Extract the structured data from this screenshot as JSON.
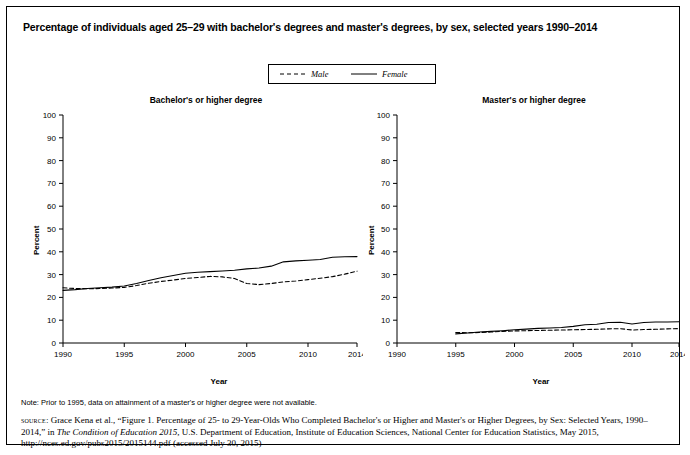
{
  "figure": {
    "title": "Percentage of individuals aged 25–29 with bachelor's degrees and master's degrees, by sex, selected years 1990–2014",
    "note": "Note: Prior to 1995, data on attainment of a master's or higher degree were not available.",
    "source_prefix": "source",
    "source_part1": ": Grace Kena et al., “Figure 1. Percentage of 25- to 29-Year-Olds Who Completed Bachelor's or Higher and Master's or Higher Degrees, by Sex: Selected Years, 1990–2014,” in ",
    "source_italic": "The Condition of Education 2015",
    "source_part2": ", U.S. Department of Education, Institute of Education Sciences, National Center for Education Statistics, May 2015, http://nces.ed.gov/pubs2015/2015144.pdf (accessed July 30, 2015)"
  },
  "legend": {
    "entries": [
      {
        "label": "Male",
        "style": "dashed"
      },
      {
        "label": "Female",
        "style": "solid"
      }
    ]
  },
  "chart_data": [
    {
      "type": "line",
      "title": "Bachelor's or higher degree",
      "xlabel": "Year",
      "ylabel": "Percent",
      "xlim": [
        1990,
        2014
      ],
      "ylim": [
        0,
        100
      ],
      "yticks": [
        0,
        10,
        20,
        30,
        40,
        50,
        60,
        70,
        80,
        90,
        100
      ],
      "xticks": [
        1990,
        1995,
        2000,
        2005,
        2010,
        2014
      ],
      "grid": false,
      "legend_position": "top-center-shared",
      "x": [
        1990,
        1991,
        1992,
        1993,
        1994,
        1995,
        1996,
        1997,
        1998,
        1999,
        2000,
        2001,
        2002,
        2003,
        2004,
        2005,
        2006,
        2007,
        2008,
        2009,
        2010,
        2011,
        2012,
        2013,
        2014
      ],
      "series": [
        {
          "name": "Male",
          "style": "dashed",
          "values": [
            24.2,
            23.9,
            23.8,
            23.9,
            24.1,
            24.4,
            25.2,
            26.2,
            27.0,
            27.6,
            28.3,
            28.7,
            29.2,
            29.0,
            28.3,
            26.1,
            25.6,
            26.1,
            26.8,
            27.2,
            27.8,
            28.4,
            29.1,
            30.2,
            31.5
          ]
        },
        {
          "name": "Female",
          "style": "solid",
          "values": [
            23.1,
            23.4,
            23.9,
            24.2,
            24.5,
            25.0,
            26.1,
            27.4,
            28.6,
            29.6,
            30.6,
            31.0,
            31.3,
            31.6,
            31.9,
            32.5,
            32.9,
            33.7,
            35.6,
            36.0,
            36.3,
            36.6,
            37.6,
            37.8,
            37.9
          ]
        }
      ]
    },
    {
      "type": "line",
      "title": "Master's or higher degree",
      "xlabel": "Year",
      "ylabel": "Percent",
      "xlim": [
        1990,
        2014
      ],
      "ylim": [
        0,
        100
      ],
      "yticks": [
        0,
        10,
        20,
        30,
        40,
        50,
        60,
        70,
        80,
        90,
        100
      ],
      "xticks": [
        1990,
        1995,
        2000,
        2005,
        2010,
        2014
      ],
      "grid": false,
      "legend_position": "top-center-shared",
      "x": [
        1995,
        1996,
        1997,
        1998,
        1999,
        2000,
        2001,
        2002,
        2003,
        2004,
        2005,
        2006,
        2007,
        2008,
        2009,
        2010,
        2011,
        2012,
        2013,
        2014
      ],
      "series": [
        {
          "name": "Male",
          "style": "dashed",
          "values": [
            4.6,
            4.5,
            4.6,
            4.8,
            5.1,
            5.3,
            5.4,
            5.5,
            5.6,
            5.7,
            5.8,
            5.9,
            6.0,
            6.2,
            6.3,
            5.7,
            5.9,
            6.0,
            6.2,
            6.3
          ]
        },
        {
          "name": "Female",
          "style": "solid",
          "values": [
            4.0,
            4.4,
            4.8,
            5.1,
            5.4,
            5.8,
            6.1,
            6.4,
            6.6,
            6.8,
            7.3,
            8.0,
            8.2,
            9.0,
            9.1,
            8.3,
            9.0,
            9.2,
            9.2,
            9.3
          ]
        }
      ]
    }
  ]
}
